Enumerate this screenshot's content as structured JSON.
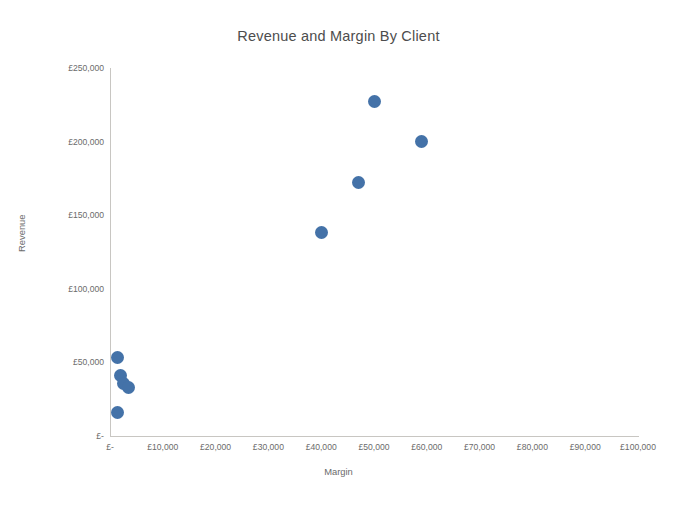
{
  "chart": {
    "title": "Revenue and Margin By Client",
    "xlabel": "Margin",
    "ylabel": "Revenue",
    "marker_color": "#4472a8",
    "axis_color": "#c8c6c2"
  },
  "chart_data": {
    "type": "scatter",
    "title": "Revenue and Margin By Client",
    "xlabel": "Margin",
    "ylabel": "Revenue",
    "xlim": [
      0,
      100000
    ],
    "ylim": [
      0,
      250000
    ],
    "grid": false,
    "legend": "none",
    "xticklabels": [
      "£-",
      "£10,000",
      "£20,000",
      "£30,000",
      "£40,000",
      "£50,000",
      "£60,000",
      "£70,000",
      "£80,000",
      "£90,000",
      "£100,000"
    ],
    "xticks": [
      0,
      10000,
      20000,
      30000,
      40000,
      50000,
      60000,
      70000,
      80000,
      90000,
      100000
    ],
    "yticklabels": [
      "£-",
      "£50,000",
      "£100,000",
      "£150,000",
      "£200,000",
      "£250,000"
    ],
    "yticks": [
      0,
      50000,
      100000,
      150000,
      200000,
      250000
    ],
    "series": [
      {
        "name": "Clients",
        "points": [
          {
            "x": 50000,
            "y": 227000
          },
          {
            "x": 59000,
            "y": 200000
          },
          {
            "x": 47000,
            "y": 172000
          },
          {
            "x": 40000,
            "y": 138000
          },
          {
            "x": 1500,
            "y": 53000
          },
          {
            "x": 2000,
            "y": 41000
          },
          {
            "x": 2500,
            "y": 36000
          },
          {
            "x": 3500,
            "y": 33000
          },
          {
            "x": 1500,
            "y": 16000
          }
        ]
      }
    ]
  }
}
